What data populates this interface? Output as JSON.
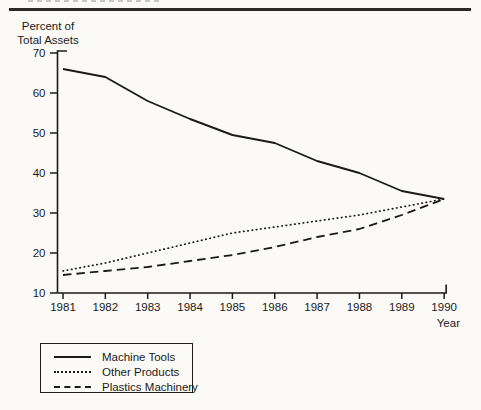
{
  "chart": {
    "y_axis_title_line1": "Percent of",
    "y_axis_title_line2": "Total Assets",
    "x_axis_title": "Year"
  },
  "legend": {
    "position": "bottom-left",
    "items": [
      {
        "label": "Machine Tools",
        "style": "solid"
      },
      {
        "label": "Other Products",
        "style": "dotted"
      },
      {
        "label": "Plastics Machinery",
        "style": "dashed"
      }
    ]
  },
  "chart_data": {
    "type": "line",
    "title": "",
    "xlabel": "Year",
    "ylabel": "Percent of Total Assets",
    "categories": [
      "1981",
      "1982",
      "1983",
      "1984",
      "1985",
      "1986",
      "1987",
      "1988",
      "1989",
      "1990"
    ],
    "ylim": [
      10,
      70
    ],
    "y_tick_step": 10,
    "y_tick_labels": [
      "10",
      "20",
      "30",
      "40",
      "50",
      "60",
      "70"
    ],
    "grid": false,
    "legend_position": "bottom-left",
    "series": [
      {
        "name": "Machine Tools",
        "style": "solid",
        "values": [
          66,
          64,
          58,
          53.5,
          49.5,
          47.5,
          43,
          40,
          35.5,
          33.5
        ]
      },
      {
        "name": "Other Products",
        "style": "dotted",
        "values": [
          15.5,
          17.5,
          20,
          22.5,
          25,
          26.5,
          28,
          29.5,
          31.5,
          33.5
        ]
      },
      {
        "name": "Plastics Machinery",
        "style": "dashed",
        "values": [
          14.5,
          15.5,
          16.5,
          18,
          19.5,
          21.5,
          24,
          26,
          29.5,
          33.5
        ]
      }
    ]
  }
}
